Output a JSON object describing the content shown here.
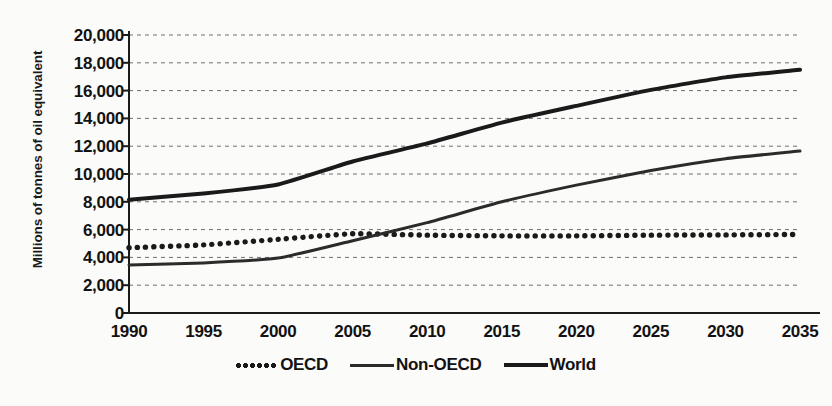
{
  "chart_data": {
    "type": "line",
    "title": "",
    "xlabel": "",
    "ylabel": "Millions of tonnes of oil equivalent",
    "x": [
      1990,
      1995,
      2000,
      2005,
      2010,
      2015,
      2020,
      2025,
      2030,
      2035
    ],
    "xtick_labels": [
      "1990",
      "1995",
      "2000",
      "2005",
      "2010",
      "2015",
      "2020",
      "2025",
      "2030",
      "2035"
    ],
    "ytick_labels": [
      "0",
      "2,000",
      "4,000",
      "6,000",
      "8,000",
      "10,000",
      "12,000",
      "14,000",
      "16,000",
      "18,000",
      "20,000"
    ],
    "ytick_values": [
      0,
      2000,
      4000,
      6000,
      8000,
      10000,
      12000,
      14000,
      16000,
      18000,
      20000
    ],
    "xlim": [
      1990,
      2035
    ],
    "ylim": [
      0,
      20000
    ],
    "grid": "horizontal-dashed",
    "legend_position": "bottom-center",
    "series": [
      {
        "name": "OECD",
        "style": "dotted",
        "color": "#1a1a1a",
        "values": [
          4700,
          4900,
          5300,
          5700,
          5600,
          5550,
          5550,
          5600,
          5620,
          5650
        ]
      },
      {
        "name": "Non-OECD",
        "style": "solid-thin",
        "color": "#2b2b2b",
        "values": [
          3450,
          3600,
          3950,
          5200,
          6500,
          8000,
          9200,
          10250,
          11100,
          11650
        ]
      },
      {
        "name": "World",
        "style": "solid-thick",
        "color": "#1a1a1a",
        "values": [
          8150,
          8600,
          9250,
          10900,
          12200,
          13700,
          14900,
          16050,
          16950,
          17500
        ]
      }
    ]
  }
}
